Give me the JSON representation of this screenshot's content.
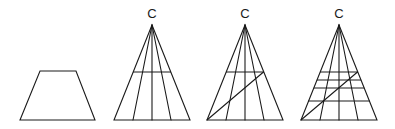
{
  "figures": [
    {
      "id": "trapezoid",
      "type": "trapezoid",
      "label": ""
    },
    {
      "id": "triangle-1",
      "type": "triangle",
      "apex_label": "C",
      "rays": 3,
      "horizontal_lines": 1,
      "diagonal": false
    },
    {
      "id": "triangle-2",
      "type": "triangle",
      "apex_label": "C",
      "rays": 3,
      "horizontal_lines": 1,
      "diagonal": true
    },
    {
      "id": "triangle-3",
      "type": "triangle",
      "apex_label": "C",
      "rays": 3,
      "horizontal_lines": 4,
      "diagonal": true
    }
  ],
  "colors": {
    "line": "#1a1a1a",
    "background": "#ffffff"
  }
}
